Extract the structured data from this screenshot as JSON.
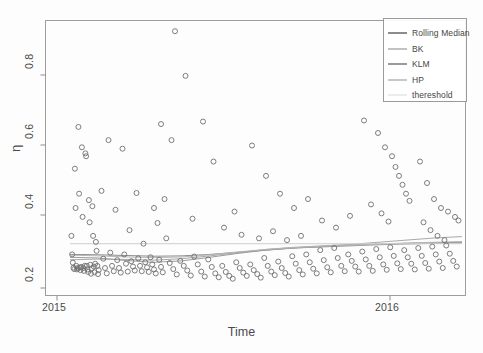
{
  "chart_data": {
    "type": "scatter",
    "title": "",
    "subtitle": "",
    "xlabel": "Time",
    "ylabel": "η",
    "xlim": [
      2014.93,
      2016.13
    ],
    "ylim": [
      0.185,
      0.955
    ],
    "xticks": [
      2015,
      2016
    ],
    "xticklabels": [
      "2015",
      "2016"
    ],
    "yticks": [
      0.2,
      0.4,
      0.6,
      0.8
    ],
    "yticklabels": [
      "0.2",
      "0.4",
      "0.6",
      "0.8"
    ],
    "grid": false,
    "frame": true,
    "legend_position": "top-right",
    "legend": [
      "Rolling Median",
      "BK",
      "KLM",
      "HP",
      "thereshold"
    ],
    "marker": "open-circle",
    "marker_color": "#6f6f6f",
    "series": [
      {
        "name": "observations",
        "type": "scatter",
        "points": [
          [
            2015.004,
            0.352
          ],
          [
            2015.006,
            0.3
          ],
          [
            2015.008,
            0.277
          ],
          [
            2015.01,
            0.263
          ],
          [
            2015.012,
            0.259
          ],
          [
            2015.014,
            0.54
          ],
          [
            2015.016,
            0.43
          ],
          [
            2015.018,
            0.268
          ],
          [
            2015.02,
            0.258
          ],
          [
            2015.022,
            0.262
          ],
          [
            2015.024,
            0.657
          ],
          [
            2015.026,
            0.47
          ],
          [
            2015.028,
            0.263
          ],
          [
            2015.03,
            0.256
          ],
          [
            2015.032,
            0.265
          ],
          [
            2015.034,
            0.6
          ],
          [
            2015.036,
            0.405
          ],
          [
            2015.038,
            0.262
          ],
          [
            2015.04,
            0.254
          ],
          [
            2015.042,
            0.268
          ],
          [
            2015.044,
            0.583
          ],
          [
            2015.046,
            0.575
          ],
          [
            2015.048,
            0.268
          ],
          [
            2015.05,
            0.258
          ],
          [
            2015.052,
            0.251
          ],
          [
            2015.054,
            0.452
          ],
          [
            2015.056,
            0.39
          ],
          [
            2015.058,
            0.271
          ],
          [
            2015.06,
            0.246
          ],
          [
            2015.062,
            0.261
          ],
          [
            2015.064,
            0.435
          ],
          [
            2015.066,
            0.352
          ],
          [
            2015.068,
            0.266
          ],
          [
            2015.07,
            0.25
          ],
          [
            2015.072,
            0.274
          ],
          [
            2015.074,
            0.335
          ],
          [
            2015.076,
            0.31
          ],
          [
            2015.078,
            0.268
          ],
          [
            2015.08,
            0.245
          ],
          [
            2015.082,
            0.256
          ],
          [
            2015.09,
            0.478
          ],
          [
            2015.095,
            0.288
          ],
          [
            2015.1,
            0.262
          ],
          [
            2015.105,
            0.247
          ],
          [
            2015.11,
            0.62
          ],
          [
            2015.115,
            0.305
          ],
          [
            2015.12,
            0.268
          ],
          [
            2015.125,
            0.253
          ],
          [
            2015.13,
            0.425
          ],
          [
            2015.135,
            0.284
          ],
          [
            2015.14,
            0.262
          ],
          [
            2015.145,
            0.249
          ],
          [
            2015.15,
            0.596
          ],
          [
            2015.155,
            0.3
          ],
          [
            2015.16,
            0.274
          ],
          [
            2015.165,
            0.252
          ],
          [
            2015.17,
            0.368
          ],
          [
            2015.175,
            0.281
          ],
          [
            2015.18,
            0.266
          ],
          [
            2015.185,
            0.255
          ],
          [
            2015.19,
            0.472
          ],
          [
            2015.195,
            0.289
          ],
          [
            2015.2,
            0.268
          ],
          [
            2015.205,
            0.253
          ],
          [
            2015.21,
            0.33
          ],
          [
            2015.215,
            0.278
          ],
          [
            2015.22,
            0.264
          ],
          [
            2015.225,
            0.251
          ],
          [
            2015.23,
            0.292
          ],
          [
            2015.235,
            0.272
          ],
          [
            2015.24,
            0.258
          ],
          [
            2015.245,
            0.247
          ],
          [
            2015.25,
            0.388
          ],
          [
            2015.255,
            0.285
          ],
          [
            2015.26,
            0.265
          ],
          [
            2015.265,
            0.25
          ],
          [
            2015.275,
            0.345
          ],
          [
            2015.285,
            0.276
          ],
          [
            2015.295,
            0.259
          ],
          [
            2015.305,
            0.244
          ],
          [
            2015.315,
            0.282
          ],
          [
            2015.325,
            0.268
          ],
          [
            2015.335,
            0.255
          ],
          [
            2015.345,
            0.241
          ],
          [
            2015.355,
            0.294
          ],
          [
            2015.365,
            0.272
          ],
          [
            2015.375,
            0.252
          ],
          [
            2015.385,
            0.238
          ],
          [
            2015.395,
            0.286
          ],
          [
            2015.405,
            0.265
          ],
          [
            2015.415,
            0.247
          ],
          [
            2015.425,
            0.236
          ],
          [
            2015.435,
            0.268
          ],
          [
            2015.445,
            0.251
          ],
          [
            2015.455,
            0.24
          ],
          [
            2015.465,
            0.232
          ],
          [
            2015.3,
            0.925
          ],
          [
            2015.33,
            0.8
          ],
          [
            2015.26,
            0.665
          ],
          [
            2015.29,
            0.62
          ],
          [
            2015.38,
            0.672
          ],
          [
            2015.41,
            0.56
          ],
          [
            2015.24,
            0.43
          ],
          [
            2015.27,
            0.455
          ],
          [
            2015.35,
            0.4
          ],
          [
            2015.44,
            0.375
          ],
          [
            2015.47,
            0.42
          ],
          [
            2015.49,
            0.355
          ],
          [
            2015.475,
            0.278
          ],
          [
            2015.485,
            0.262
          ],
          [
            2015.495,
            0.249
          ],
          [
            2015.505,
            0.24
          ],
          [
            2015.515,
            0.272
          ],
          [
            2015.525,
            0.256
          ],
          [
            2015.535,
            0.245
          ],
          [
            2015.545,
            0.235
          ],
          [
            2015.555,
            0.29
          ],
          [
            2015.565,
            0.268
          ],
          [
            2015.575,
            0.252
          ],
          [
            2015.585,
            0.242
          ],
          [
            2015.595,
            0.28
          ],
          [
            2015.605,
            0.262
          ],
          [
            2015.615,
            0.248
          ],
          [
            2015.625,
            0.238
          ],
          [
            2015.635,
            0.295
          ],
          [
            2015.645,
            0.274
          ],
          [
            2015.655,
            0.256
          ],
          [
            2015.665,
            0.244
          ],
          [
            2015.675,
            0.3
          ],
          [
            2015.685,
            0.278
          ],
          [
            2015.695,
            0.26
          ],
          [
            2015.705,
            0.247
          ],
          [
            2015.715,
            0.312
          ],
          [
            2015.725,
            0.284
          ],
          [
            2015.735,
            0.264
          ],
          [
            2015.745,
            0.25
          ],
          [
            2015.755,
            0.318
          ],
          [
            2015.765,
            0.29
          ],
          [
            2015.775,
            0.268
          ],
          [
            2015.785,
            0.253
          ],
          [
            2015.52,
            0.605
          ],
          [
            2015.56,
            0.52
          ],
          [
            2015.6,
            0.47
          ],
          [
            2015.64,
            0.43
          ],
          [
            2015.68,
            0.455
          ],
          [
            2015.72,
            0.395
          ],
          [
            2015.76,
            0.375
          ],
          [
            2015.8,
            0.408
          ],
          [
            2015.54,
            0.345
          ],
          [
            2015.58,
            0.365
          ],
          [
            2015.62,
            0.34
          ],
          [
            2015.66,
            0.352
          ],
          [
            2015.795,
            0.3
          ],
          [
            2015.805,
            0.282
          ],
          [
            2015.815,
            0.266
          ],
          [
            2015.825,
            0.252
          ],
          [
            2015.835,
            0.308
          ],
          [
            2015.845,
            0.286
          ],
          [
            2015.855,
            0.268
          ],
          [
            2015.865,
            0.254
          ],
          [
            2015.875,
            0.315
          ],
          [
            2015.885,
            0.292
          ],
          [
            2015.895,
            0.272
          ],
          [
            2015.905,
            0.257
          ],
          [
            2015.915,
            0.32
          ],
          [
            2015.925,
            0.296
          ],
          [
            2015.935,
            0.275
          ],
          [
            2015.945,
            0.259
          ],
          [
            2015.84,
            0.675
          ],
          [
            2015.88,
            0.64
          ],
          [
            2015.9,
            0.6
          ],
          [
            2015.92,
            0.575
          ],
          [
            2015.93,
            0.545
          ],
          [
            2015.94,
            0.52
          ],
          [
            2015.95,
            0.495
          ],
          [
            2015.96,
            0.47
          ],
          [
            2015.86,
            0.44
          ],
          [
            2015.89,
            0.415
          ],
          [
            2015.91,
            0.392
          ],
          [
            2015.97,
            0.45
          ],
          [
            2015.955,
            0.312
          ],
          [
            2015.965,
            0.292
          ],
          [
            2015.975,
            0.274
          ],
          [
            2015.985,
            0.258
          ],
          [
            2015.995,
            0.318
          ],
          [
            2016.005,
            0.296
          ],
          [
            2016.015,
            0.276
          ],
          [
            2016.025,
            0.26
          ],
          [
            2016.035,
            0.322
          ],
          [
            2016.045,
            0.3
          ],
          [
            2016.055,
            0.28
          ],
          [
            2016.065,
            0.262
          ],
          [
            2016.0,
            0.56
          ],
          [
            2016.02,
            0.5
          ],
          [
            2016.04,
            0.455
          ],
          [
            2016.06,
            0.43
          ],
          [
            2016.01,
            0.39
          ],
          [
            2016.03,
            0.368
          ],
          [
            2016.05,
            0.352
          ],
          [
            2016.07,
            0.34
          ],
          [
            2016.075,
            0.325
          ],
          [
            2016.085,
            0.302
          ],
          [
            2016.095,
            0.282
          ],
          [
            2016.105,
            0.266
          ],
          [
            2016.08,
            0.42
          ],
          [
            2016.1,
            0.405
          ],
          [
            2016.11,
            0.395
          ]
        ]
      },
      {
        "name": "Rolling Median",
        "type": "line",
        "color": "#8c8c8c",
        "x": [
          2015.0,
          2015.08,
          2015.16,
          2015.24,
          2015.32,
          2015.4,
          2015.48,
          2015.56,
          2015.64,
          2015.72,
          2015.8,
          2015.88,
          2015.96,
          2016.04,
          2016.12
        ],
        "y": [
          0.3,
          0.299,
          0.297,
          0.295,
          0.296,
          0.3,
          0.306,
          0.312,
          0.318,
          0.322,
          0.326,
          0.329,
          0.331,
          0.333,
          0.334
        ]
      },
      {
        "name": "BK",
        "type": "line",
        "color": "#a9a9a9",
        "x": [
          2015.0,
          2015.08,
          2015.16,
          2015.24,
          2015.32,
          2015.4,
          2015.48,
          2015.56,
          2015.64,
          2015.72,
          2015.8,
          2015.88,
          2015.96,
          2016.04,
          2016.12
        ],
        "y": [
          0.285,
          0.287,
          0.286,
          0.284,
          0.288,
          0.296,
          0.305,
          0.314,
          0.32,
          0.324,
          0.328,
          0.334,
          0.34,
          0.346,
          0.35
        ]
      },
      {
        "name": "KLM",
        "type": "line",
        "color": "#9b9b9b",
        "x": [
          2015.0,
          2015.08,
          2015.16,
          2015.24,
          2015.32,
          2015.4,
          2015.48,
          2015.56,
          2015.64,
          2015.72,
          2015.8,
          2015.88,
          2015.96,
          2016.04,
          2016.12
        ],
        "y": [
          0.292,
          0.29,
          0.283,
          0.278,
          0.282,
          0.292,
          0.303,
          0.312,
          0.318,
          0.321,
          0.324,
          0.327,
          0.329,
          0.331,
          0.332
        ]
      },
      {
        "name": "HP",
        "type": "line",
        "color": "#b5b5b5",
        "x": [
          2015.0,
          2015.08,
          2015.16,
          2015.24,
          2015.32,
          2015.4,
          2015.48,
          2015.56,
          2015.64,
          2015.72,
          2015.8,
          2015.88,
          2015.96,
          2016.04,
          2016.12
        ],
        "y": [
          0.298,
          0.296,
          0.293,
          0.291,
          0.293,
          0.299,
          0.307,
          0.314,
          0.319,
          0.323,
          0.326,
          0.329,
          0.332,
          0.334,
          0.336
        ]
      },
      {
        "name": "thereshold",
        "type": "line",
        "color": "#cfcfcf",
        "x": [
          2015.0,
          2016.12
        ],
        "y": [
          0.33,
          0.33
        ]
      }
    ]
  },
  "axes": {
    "y_title": "η",
    "x_title": "Time",
    "ytick_labels": [
      "0.8",
      "0.6",
      "0.4",
      "0.2"
    ],
    "xtick_labels": [
      "2015",
      "2016"
    ]
  },
  "legend": {
    "entries": [
      {
        "label": "Rolling Median",
        "color": "#8c8c8c",
        "has_line": true
      },
      {
        "label": "BK",
        "color": "#c2c2c2",
        "has_line": true
      },
      {
        "label": "KLM",
        "color": "#9b9b9b",
        "has_line": true
      },
      {
        "label": "HP",
        "color": "#c8c8c8",
        "has_line": true
      },
      {
        "label": "thereshold",
        "color": "#ececec",
        "has_line": true
      }
    ]
  }
}
